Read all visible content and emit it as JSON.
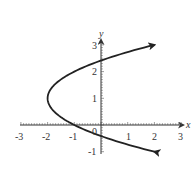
{
  "chart_data": {
    "type": "line",
    "title": "",
    "xlabel": "x",
    "ylabel": "y",
    "xlim": [
      -3,
      3
    ],
    "ylim": [
      -1,
      3
    ],
    "xticks": [
      "-3",
      "-2",
      "-1",
      "0",
      "1",
      "2",
      "3"
    ],
    "yticks": [
      "-1",
      "1",
      "2",
      "3"
    ],
    "origin_label": "0",
    "grid": false,
    "legend": null,
    "series": [
      {
        "name": "x = (y - 1)^2 - 2",
        "points": [
          [
            2,
            3
          ],
          [
            1,
            2.73
          ],
          [
            0,
            2.41
          ],
          [
            -1,
            2
          ],
          [
            -1.75,
            1.5
          ],
          [
            -2,
            1
          ],
          [
            -1.75,
            0.5
          ],
          [
            -1,
            0
          ],
          [
            0,
            -0.41
          ],
          [
            1,
            -0.73
          ],
          [
            2,
            -1
          ]
        ],
        "arrows_at_ends": true
      }
    ],
    "colors": {
      "curve": "#222222",
      "axis": "#333333"
    }
  }
}
